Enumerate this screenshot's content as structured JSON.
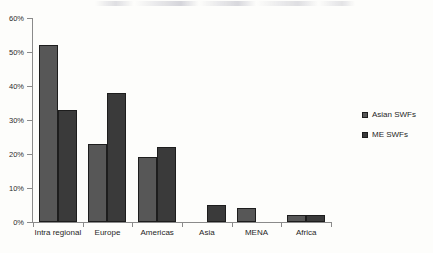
{
  "chart_data": {
    "type": "bar",
    "title": "",
    "subtitle": "",
    "xlabel": "",
    "ylabel": "",
    "categories": [
      "Intra regional",
      "Europe",
      "Americas",
      "Asia",
      "MENA",
      "Africa"
    ],
    "series": [
      {
        "name": "Asian SWFs",
        "color": "#575757",
        "values": [
          52,
          23,
          19,
          null,
          4,
          2
        ]
      },
      {
        "name": "ME SWFs",
        "color": "#3a3a3a",
        "values": [
          33,
          38,
          22,
          5,
          null,
          2
        ]
      }
    ],
    "ylim": [
      0,
      60
    ],
    "ytick_values": [
      0,
      10,
      20,
      30,
      40,
      50,
      60
    ],
    "ytick_labels": [
      "0%",
      "10%",
      "20%",
      "30%",
      "40%",
      "50%",
      "60%"
    ],
    "grid": false,
    "legend_position": "right",
    "value_format": "percent",
    "background_color": "#fdfdfb",
    "axis_color": "#8a8a8a"
  },
  "legend": {
    "items": [
      {
        "label": "Asian SWFs"
      },
      {
        "label": "ME SWFs"
      }
    ]
  }
}
